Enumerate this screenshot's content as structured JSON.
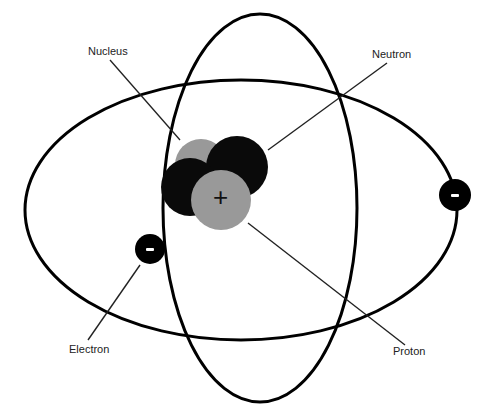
{
  "diagram": {
    "labels": {
      "nucleus": "Nucleus",
      "neutron": "Neutron",
      "electron": "Electron",
      "proton": "Proton"
    },
    "proton_symbol": "+",
    "electron_symbol": "-",
    "colors": {
      "orbit": "#000000",
      "neutron": "#0a0a0a",
      "proton": "#999999",
      "electron": "#000000",
      "leader_line": "#222222",
      "background": "#ffffff"
    },
    "particles": {
      "neutron_count": 2,
      "proton_count": 2,
      "electron_count": 2
    }
  }
}
